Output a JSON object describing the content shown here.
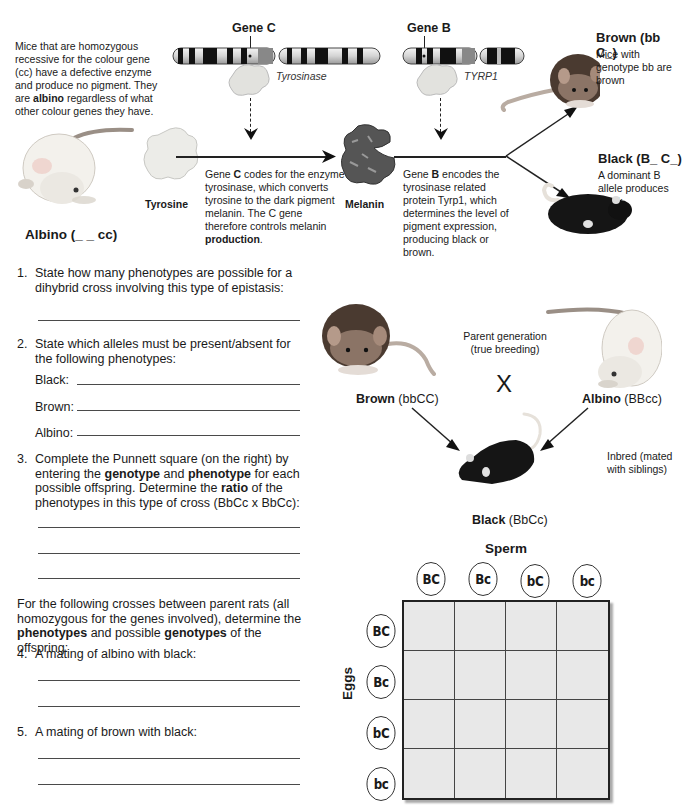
{
  "intro": {
    "albino_desc_pre": "Mice that are homozygous recessive for the colour gene (cc) have a defective enzyme and produce no pigment. They are ",
    "albino_desc_bold": "albino",
    "albino_desc_post": " regardless of what other colour genes they have.",
    "albino_label": "Albino (_ _ cc)"
  },
  "pathway": {
    "gene_c_label": "Gene C",
    "gene_b_label": "Gene B",
    "enzyme_c": "Tyrosinase",
    "enzyme_b": "TYRP1",
    "substrate": "Tyrosine",
    "product": "Melanin",
    "gene_c_desc_1": "Gene ",
    "gene_c_desc_bold1": "C",
    "gene_c_desc_2": " codes for the enzyme tyrosinase, which converts tyrosine to the dark pigment melanin. The C gene therefore controls melanin ",
    "gene_c_desc_bold2": "production",
    "gene_c_desc_3": ".",
    "gene_b_desc_1": "Gene ",
    "gene_b_desc_bold": "B",
    "gene_b_desc_2": " encodes the tyrosinase related protein Tyrp1, which determines the level of pigment expression, producing black or brown."
  },
  "phenotypes": {
    "brown_title": "Brown (bb C_)",
    "brown_desc": "Mice with genotype bb are brown",
    "black_title": "Black (B_ C_)",
    "black_desc": "A dominant B allele produces black."
  },
  "questions": {
    "q1_num": "1.",
    "q1_text": "State how many phenotypes are possible for a dihybrid cross involving this type of epistasis:",
    "q2_num": "2.",
    "q2_text": "State which alleles must be present/absent for the following phenotypes:",
    "q2_black": "Black:",
    "q2_brown": "Brown:",
    "q2_albino": "Albino:",
    "q3_num": "3.",
    "q3_t1": "Complete the Punnett square (on the right) by entering the ",
    "q3_b1": "genotype",
    "q3_t2": " and ",
    "q3_b2": "phenotype",
    "q3_t3": " for each possible offspring. Determine the ",
    "q3_b3": "ratio",
    "q3_t4": " of the phenotypes in this type of cross (BbCc x BbCc):",
    "crosses_t1": "For the following crosses between parent rats (all homozygous for the genes involved), determine the ",
    "crosses_b1": "phenotypes",
    "crosses_t2": " and possible ",
    "crosses_b2": "genotypes",
    "crosses_t3": " of the offspring:",
    "q4_num": "4.",
    "q4_text": "A mating of albino with black:",
    "q5_num": "5.",
    "q5_text": "A mating of brown with black:"
  },
  "cross": {
    "parent_gen_line1": "Parent generation",
    "parent_gen_line2": "(true breeding)",
    "cross_symbol": "X",
    "brown_parent_bold": "Brown",
    "brown_parent_geno": " (bbCC)",
    "albino_parent_bold": "Albino",
    "albino_parent_geno": " (BBcc)",
    "inbred_line1": "Inbred (mated",
    "inbred_line2": "with siblings)",
    "offspring_bold": "Black",
    "offspring_geno": " (BbCc)"
  },
  "punnett": {
    "sperm_label": "Sperm",
    "eggs_label": "Eggs",
    "sperm_alleles": [
      "BC",
      "Bc",
      "bC",
      "bc"
    ],
    "egg_alleles": [
      "BC",
      "Bc",
      "bC",
      "bc"
    ],
    "cells": [
      [
        "",
        "",
        "",
        ""
      ],
      [
        "",
        "",
        "",
        ""
      ],
      [
        "",
        "",
        "",
        ""
      ],
      [
        "",
        "",
        "",
        ""
      ]
    ]
  }
}
